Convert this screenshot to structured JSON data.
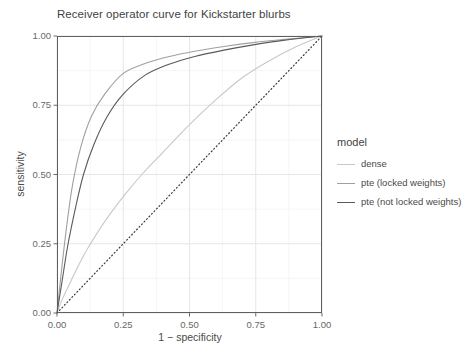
{
  "chart_data": {
    "type": "line",
    "title": "Receiver operator curve for Kickstarter blurbs",
    "xlabel": "1 − specificity",
    "ylabel": "sensitivity",
    "xlim": [
      0,
      1
    ],
    "ylim": [
      0,
      1
    ],
    "xticks": [
      "0.00",
      "0.25",
      "0.50",
      "0.75",
      "1.00"
    ],
    "yticks": [
      "0.00",
      "0.25",
      "0.50",
      "0.75",
      "1.00"
    ],
    "xtick_values": [
      0,
      0.25,
      0.5,
      0.75,
      1
    ],
    "ytick_values": [
      0,
      0.25,
      0.5,
      0.75,
      1
    ],
    "grid": true,
    "legend_title": "model",
    "legend_position": "right",
    "reference_line": {
      "name": "chance-diagonal",
      "style": "dotted",
      "color": "#3a3a3a",
      "x": [
        0,
        1
      ],
      "y": [
        0,
        1
      ]
    },
    "series": [
      {
        "name": "dense",
        "color": "#c8c8c8",
        "x": [
          0,
          0.02,
          0.05,
          0.08,
          0.12,
          0.18,
          0.25,
          0.32,
          0.4,
          0.5,
          0.6,
          0.7,
          0.8,
          0.9,
          1
        ],
        "y": [
          0,
          0.05,
          0.11,
          0.17,
          0.24,
          0.33,
          0.42,
          0.5,
          0.58,
          0.68,
          0.77,
          0.85,
          0.91,
          0.96,
          1
        ]
      },
      {
        "name": "pte (locked weights)",
        "color": "#a0a0a0",
        "x": [
          0,
          0.02,
          0.04,
          0.06,
          0.09,
          0.13,
          0.18,
          0.25,
          0.33,
          0.42,
          0.52,
          0.63,
          0.74,
          0.86,
          1
        ],
        "y": [
          0,
          0.18,
          0.34,
          0.47,
          0.6,
          0.71,
          0.79,
          0.865,
          0.9,
          0.925,
          0.945,
          0.962,
          0.976,
          0.988,
          1
        ]
      },
      {
        "name": "pte (not locked weights)",
        "color": "#5a5a5a",
        "x": [
          0,
          0.02,
          0.04,
          0.07,
          0.1,
          0.14,
          0.19,
          0.25,
          0.33,
          0.42,
          0.52,
          0.63,
          0.74,
          0.86,
          1
        ],
        "y": [
          0,
          0.12,
          0.24,
          0.38,
          0.5,
          0.61,
          0.71,
          0.79,
          0.857,
          0.897,
          0.926,
          0.949,
          0.968,
          0.985,
          1
        ]
      }
    ]
  },
  "panel": {
    "left": 57,
    "right": 322,
    "top": 36,
    "bottom": 313,
    "border_color": "#5f5f5f",
    "background": "#ffffff",
    "gridline_color": "#f0f0f0"
  }
}
